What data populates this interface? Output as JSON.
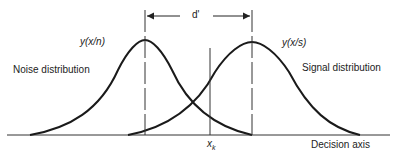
{
  "diagram": {
    "labels": {
      "d_prime": "d'",
      "noise_density": "y(x/n)",
      "signal_density": "y(x/s)",
      "noise_distribution": "Noise distribution",
      "signal_distribution": "Signal distribution",
      "criterion": "x",
      "criterion_sub": "k",
      "axis": "Decision axis"
    },
    "colors": {
      "stroke": "#1a1a1a",
      "text": "#222222"
    }
  }
}
